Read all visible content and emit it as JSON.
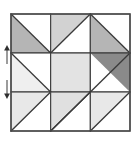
{
  "figure": {
    "name": "quilt-block-diagram",
    "background_color": "#ffffff",
    "canvas": {
      "width": 136,
      "height": 143
    }
  },
  "block": {
    "x": 11,
    "y": 14,
    "width": 119,
    "height": 117,
    "rows": 3,
    "cols": 3,
    "border_color": "#4a4a4a",
    "grid_line_color": "#3a3a3a",
    "diagonal_color": "#3a3a3a"
  },
  "palette": {
    "white": "#ffffff",
    "very_light_gray": "#efefef",
    "light_gray": "#e3e3e3",
    "pale_gray": "#e8e8e8",
    "medium_gray": "#b5b5b5",
    "mid_gray": "#bdbdbd",
    "dark_gray": "#8a8a8a"
  },
  "cells": [
    {
      "id": "cell-r1c1",
      "row": 1,
      "col": 1,
      "type": "half-square-triangle",
      "diagonal": "tl-br",
      "shaded_half": "lower-left",
      "shaded_color": "#b5b5b5",
      "unshaded_color": "#ffffff"
    },
    {
      "id": "cell-r1c2",
      "row": 1,
      "col": 2,
      "type": "half-square-triangle",
      "diagonal": "bl-tr",
      "shaded_half": "upper-left",
      "shaded_color": "#d2d2d2",
      "unshaded_color": "#ffffff"
    },
    {
      "id": "cell-r1c3",
      "row": 1,
      "col": 3,
      "type": "half-square-triangle",
      "diagonal": "tl-br",
      "shaded_half": "lower-left",
      "shaded_color": "#b5b5b5",
      "unshaded_color": "#ffffff"
    },
    {
      "id": "cell-r2c1",
      "row": 2,
      "col": 1,
      "type": "half-square-triangle",
      "diagonal": "tl-br",
      "shaded_half": "lower-left",
      "shaded_color": "#efefef",
      "unshaded_color": "#ffffff"
    },
    {
      "id": "cell-r2c2",
      "row": 2,
      "col": 2,
      "type": "solid",
      "diagonal": "none",
      "shaded_half": "all",
      "shaded_color": "#e3e3e3",
      "unshaded_color": "#e3e3e3"
    },
    {
      "id": "cell-r2c3",
      "row": 2,
      "col": 3,
      "type": "half-square-triangle",
      "diagonal": "bl-tr",
      "shaded_half": "upper-right",
      "shaded_color": "#8a8a8a",
      "unshaded_color": "#ffffff"
    },
    {
      "id": "cell-r3c1",
      "row": 3,
      "col": 1,
      "type": "half-square-triangle",
      "diagonal": "tl-br",
      "shaded_half": "upper-right",
      "shaded_color": "#e8e8e8",
      "unshaded_color": "#ffffff"
    },
    {
      "id": "cell-r3c2",
      "row": 3,
      "col": 2,
      "type": "half-square-triangle",
      "diagonal": "bl-tr",
      "shaded_half": "upper-left",
      "shaded_color": "#e0e0e0",
      "unshaded_color": "#ffffff"
    },
    {
      "id": "cell-r3c3",
      "row": 3,
      "col": 3,
      "type": "half-square-triangle",
      "diagonal": "tl-br",
      "shaded_half": "upper-right",
      "shaded_color": "#e8e8e8",
      "unshaded_color": "#ffffff"
    }
  ],
  "markers": [
    {
      "id": "marker-upper",
      "label": "",
      "x": 7,
      "y_top": 45,
      "y_bottom": 64,
      "direction": "up",
      "color": "#2e2e2e"
    },
    {
      "id": "marker-lower",
      "label": "",
      "x": 7,
      "y_top": 80,
      "y_bottom": 99,
      "direction": "down",
      "color": "#2e2e2e"
    }
  ]
}
